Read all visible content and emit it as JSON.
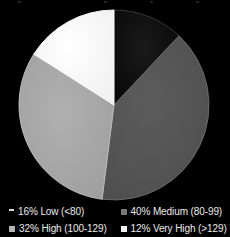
{
  "background_color": "#000000",
  "chart_data": {
    "type": "pie",
    "title": "",
    "legend_position": "bottom",
    "start_angle_deg": 0,
    "direction": "clockwise",
    "center": {
      "x": 114,
      "y": 105
    },
    "radius": 95,
    "categories": [
      "Very High (>129)",
      "Medium (80-99)",
      "High (100-129)",
      "Low (<80)"
    ],
    "values": [
      12,
      40,
      32,
      16
    ],
    "slices": [
      {
        "name": "very-high",
        "label": "12% Very High (>129)",
        "percent_text": "12%",
        "category": "Very High",
        "range": "(>129)",
        "value": 12,
        "color": "#0d0d0d",
        "edge_color": "#3a3a3a",
        "start_deg": 0,
        "end_deg": 43.2
      },
      {
        "name": "medium",
        "label": "40% Medium (80-99)",
        "percent_text": "40%",
        "category": "Medium",
        "range": "(80-99)",
        "value": 40,
        "color": "#555555",
        "edge_color": "#6e6e6e",
        "start_deg": 43.2,
        "end_deg": 187.2
      },
      {
        "name": "high",
        "label": "32% High (100-129)",
        "percent_text": "32%",
        "category": "High",
        "range": "(100-129)",
        "value": 32,
        "color": "#a8a8a8",
        "edge_color": "#c2c2c2",
        "start_deg": 187.2,
        "end_deg": 302.4
      },
      {
        "name": "low",
        "label": "16% Low (<80)",
        "percent_text": "16%",
        "category": "Low",
        "range": "(<80)",
        "value": 16,
        "color": "#fbfbfb",
        "edge_color": "#ffffff",
        "start_deg": 302.4,
        "end_deg": 360
      }
    ]
  },
  "legend": {
    "items": [
      {
        "label": "16% Low (<80)",
        "swatch_color": "#d9d9d9",
        "swatch_shape": "dash",
        "icon": "legend-swatch-icon"
      },
      {
        "label": "40% Medium (80-99)",
        "swatch_color": "#777777",
        "swatch_shape": "square",
        "icon": "legend-swatch-icon"
      },
      {
        "label": "32% High (100-129)",
        "swatch_color": "#b5b5b5",
        "swatch_shape": "square",
        "icon": "legend-swatch-icon"
      },
      {
        "label": "12% Very High (>129)",
        "swatch_color": "#f2f2f2",
        "swatch_shape": "square",
        "icon": "legend-swatch-icon"
      }
    ]
  }
}
